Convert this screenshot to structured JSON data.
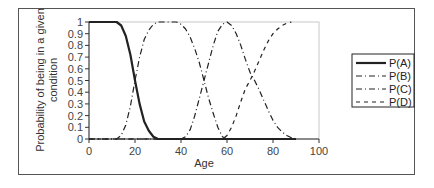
{
  "chart_data": {
    "type": "line",
    "title": "",
    "xlabel": "Age",
    "ylabel": "Probability of being in a given condition",
    "ylabel_lines": [
      "Probability of being in a given",
      "condition"
    ],
    "xlim": [
      0,
      100
    ],
    "ylim": [
      0,
      1
    ],
    "x_ticks": [
      0,
      20,
      40,
      60,
      80,
      100
    ],
    "y_ticks": [
      0,
      0.1,
      0.2,
      0.3,
      0.4,
      0.5,
      0.6,
      0.7,
      0.8,
      0.9,
      1
    ],
    "y_tick_labels": [
      "0",
      "0.1",
      "0.2",
      "0.3",
      "0.4",
      "0.5",
      "0.6",
      "0.7",
      "0.8",
      "0.9",
      "1"
    ],
    "x_tick_labels": [
      "0",
      "20",
      "40",
      "60",
      "80",
      "100"
    ],
    "grid": false,
    "legend_position": "right",
    "series": [
      {
        "name": "P(A)",
        "style": "solid-thick",
        "x": [
          0,
          10,
          12,
          14,
          16,
          18,
          20,
          22,
          24,
          26,
          28,
          30,
          40,
          50,
          60,
          70,
          80,
          90
        ],
        "values": [
          1,
          1,
          1,
          0.97,
          0.88,
          0.72,
          0.5,
          0.3,
          0.15,
          0.07,
          0.02,
          0,
          0,
          0,
          0,
          0,
          0,
          0
        ]
      },
      {
        "name": "P(B)",
        "style": "dash-dot",
        "x": [
          0,
          10,
          12,
          14,
          16,
          18,
          20,
          22,
          24,
          26,
          28,
          30,
          35,
          38,
          40,
          42,
          44,
          46,
          48,
          50,
          52,
          54,
          56,
          58,
          60,
          70,
          80,
          90
        ],
        "values": [
          0,
          0,
          0,
          0.03,
          0.12,
          0.28,
          0.5,
          0.7,
          0.85,
          0.93,
          0.98,
          1,
          1,
          1,
          0.98,
          0.94,
          0.87,
          0.77,
          0.65,
          0.5,
          0.35,
          0.22,
          0.1,
          0.02,
          0,
          0,
          0,
          0
        ]
      },
      {
        "name": "P(C)",
        "style": "dash-dot",
        "x": [
          0,
          40,
          42,
          44,
          46,
          48,
          50,
          52,
          54,
          56,
          58,
          60,
          62,
          64,
          66,
          68,
          70,
          72,
          74,
          76,
          78,
          80,
          82,
          84,
          86,
          88,
          90
        ],
        "values": [
          0,
          0,
          0.02,
          0.08,
          0.2,
          0.35,
          0.5,
          0.65,
          0.8,
          0.92,
          0.98,
          1,
          0.97,
          0.9,
          0.8,
          0.68,
          0.57,
          0.5,
          0.42,
          0.33,
          0.24,
          0.16,
          0.1,
          0.06,
          0.03,
          0.01,
          0
        ]
      },
      {
        "name": "P(D)",
        "style": "dashed",
        "x": [
          0,
          56,
          58,
          60,
          62,
          64,
          66,
          68,
          70,
          72,
          74,
          76,
          78,
          80,
          82,
          84,
          86,
          88
        ],
        "values": [
          0,
          0,
          0,
          0.03,
          0.1,
          0.2,
          0.32,
          0.43,
          0.5,
          0.58,
          0.67,
          0.76,
          0.84,
          0.9,
          0.94,
          0.97,
          0.99,
          1
        ]
      }
    ]
  },
  "legend": {
    "items": [
      {
        "label": "P(A)",
        "style": "solid-thick"
      },
      {
        "label": "P(B)",
        "style": "dash-dot"
      },
      {
        "label": "P(C)",
        "style": "dash-dot"
      },
      {
        "label": "P(D)",
        "style": "dashed"
      }
    ]
  },
  "colors": {
    "series": "#222222",
    "axis": "#333333",
    "border": "#555555",
    "plot_border": "#bbbbbb"
  }
}
